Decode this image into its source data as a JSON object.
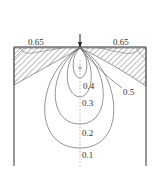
{
  "figure": {
    "type": "stress contour diagram",
    "load": "point-load-arrow",
    "contour_labels": [
      {
        "id": "top-left",
        "text": "0.65",
        "x": 28,
        "y": 38
      },
      {
        "id": "top-right",
        "text": "0.65",
        "x": 113,
        "y": 38
      },
      {
        "id": "c04",
        "text": "0.4",
        "x": 83,
        "y": 82
      },
      {
        "id": "c05",
        "text": "0.5",
        "x": 123,
        "y": 88
      },
      {
        "id": "c03",
        "text": "0.3",
        "x": 82,
        "y": 99
      },
      {
        "id": "c02",
        "text": "0.2",
        "x": 82,
        "y": 129
      },
      {
        "id": "c01",
        "text": "0.1",
        "x": 82,
        "y": 151
      }
    ],
    "line_color": "#555555",
    "hatch_color": "#444444"
  }
}
